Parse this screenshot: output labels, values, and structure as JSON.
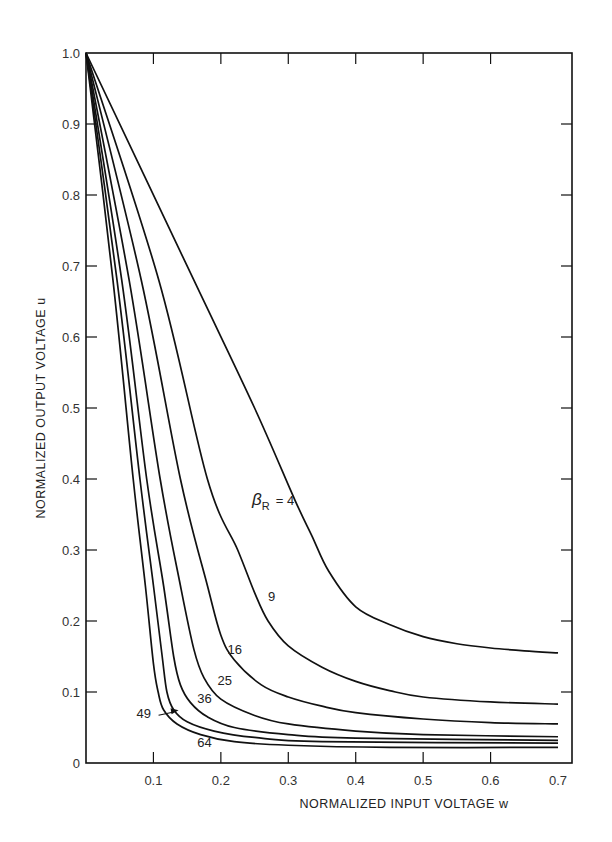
{
  "chart_data": {
    "type": "line",
    "title": "",
    "xlabel": "NORMALIZED INPUT VOLTAGE w",
    "ylabel": "NORMALIZED OUTPUT VOLTAGE u",
    "xlim": [
      0,
      0.7
    ],
    "ylim": [
      0,
      1.0
    ],
    "grid": false,
    "legend": "inline curve labels",
    "x_ticks": [
      "0.1",
      "0.2",
      "0.3",
      "0.4",
      "0.5",
      "0.6",
      "0.7"
    ],
    "y_ticks": [
      "0",
      "0.1",
      "0.2",
      "0.3",
      "0.4",
      "0.5",
      "0.6",
      "0.7",
      "0.8",
      "0.9",
      "1.0"
    ],
    "parameter_label": "βR = 4",
    "series": [
      {
        "name": "4",
        "points": [
          [
            0,
            1.0
          ],
          [
            0.16,
            0.68
          ],
          [
            0.25,
            0.5
          ],
          [
            0.31,
            0.37
          ],
          [
            0.335,
            0.32
          ],
          [
            0.36,
            0.27
          ],
          [
            0.4,
            0.22
          ],
          [
            0.45,
            0.195
          ],
          [
            0.5,
            0.178
          ],
          [
            0.55,
            0.168
          ],
          [
            0.6,
            0.162
          ],
          [
            0.65,
            0.158
          ],
          [
            0.7,
            0.155
          ]
        ]
      },
      {
        "name": "9",
        "points": [
          [
            0,
            1.0
          ],
          [
            0.108,
            0.68
          ],
          [
            0.18,
            0.4
          ],
          [
            0.225,
            0.3
          ],
          [
            0.25,
            0.24
          ],
          [
            0.27,
            0.2
          ],
          [
            0.3,
            0.165
          ],
          [
            0.35,
            0.135
          ],
          [
            0.4,
            0.115
          ],
          [
            0.45,
            0.102
          ],
          [
            0.5,
            0.093
          ],
          [
            0.6,
            0.086
          ],
          [
            0.7,
            0.083
          ]
        ]
      },
      {
        "name": "16",
        "points": [
          [
            0,
            1.0
          ],
          [
            0.082,
            0.68
          ],
          [
            0.14,
            0.4
          ],
          [
            0.18,
            0.25
          ],
          [
            0.2,
            0.18
          ],
          [
            0.22,
            0.145
          ],
          [
            0.26,
            0.11
          ],
          [
            0.3,
            0.093
          ],
          [
            0.35,
            0.08
          ],
          [
            0.4,
            0.071
          ],
          [
            0.5,
            0.062
          ],
          [
            0.6,
            0.057
          ],
          [
            0.7,
            0.055
          ]
        ]
      },
      {
        "name": "25",
        "points": [
          [
            0,
            1.0
          ],
          [
            0.064,
            0.68
          ],
          [
            0.11,
            0.4
          ],
          [
            0.14,
            0.25
          ],
          [
            0.16,
            0.16
          ],
          [
            0.175,
            0.12
          ],
          [
            0.2,
            0.09
          ],
          [
            0.25,
            0.067
          ],
          [
            0.3,
            0.055
          ],
          [
            0.4,
            0.045
          ],
          [
            0.5,
            0.04
          ],
          [
            0.7,
            0.037
          ]
        ]
      },
      {
        "name": "36",
        "points": [
          [
            0,
            1.0
          ],
          [
            0.053,
            0.68
          ],
          [
            0.09,
            0.4
          ],
          [
            0.115,
            0.25
          ],
          [
            0.13,
            0.15
          ],
          [
            0.14,
            0.11
          ],
          [
            0.155,
            0.085
          ],
          [
            0.18,
            0.065
          ],
          [
            0.22,
            0.05
          ],
          [
            0.3,
            0.04
          ],
          [
            0.4,
            0.035
          ],
          [
            0.7,
            0.032
          ]
        ]
      },
      {
        "name": "49",
        "points": [
          [
            0,
            1.0
          ],
          [
            0.046,
            0.68
          ],
          [
            0.08,
            0.4
          ],
          [
            0.1,
            0.25
          ],
          [
            0.113,
            0.15
          ],
          [
            0.12,
            0.1
          ],
          [
            0.13,
            0.075
          ],
          [
            0.15,
            0.058
          ],
          [
            0.19,
            0.045
          ],
          [
            0.25,
            0.036
          ],
          [
            0.35,
            0.03
          ],
          [
            0.7,
            0.028
          ]
        ]
      },
      {
        "name": "64",
        "points": [
          [
            0,
            1.0
          ],
          [
            0.04,
            0.68
          ],
          [
            0.07,
            0.4
          ],
          [
            0.088,
            0.25
          ],
          [
            0.1,
            0.14
          ],
          [
            0.107,
            0.1
          ],
          [
            0.115,
            0.075
          ],
          [
            0.135,
            0.055
          ],
          [
            0.17,
            0.04
          ],
          [
            0.22,
            0.03
          ],
          [
            0.3,
            0.025
          ],
          [
            0.45,
            0.022
          ],
          [
            0.7,
            0.022
          ]
        ]
      }
    ],
    "curve_labels": [
      {
        "text": "9",
        "w": 0.27,
        "u": 0.228
      },
      {
        "text": "16",
        "w": 0.21,
        "u": 0.153
      },
      {
        "text": "25",
        "w": 0.195,
        "u": 0.11
      },
      {
        "text": "36",
        "w": 0.165,
        "u": 0.085
      },
      {
        "text": "49",
        "w": 0.075,
        "u": 0.063
      },
      {
        "text": "64",
        "w": 0.165,
        "u": 0.022
      }
    ]
  },
  "labels": {
    "xlabel": "NORMALIZED INPUT VOLTAGE w",
    "ylabel": "NORMALIZED OUTPUT VOLTAGE u",
    "beta": "β",
    "beta_sub": "R",
    "beta_eq": "=  4"
  }
}
